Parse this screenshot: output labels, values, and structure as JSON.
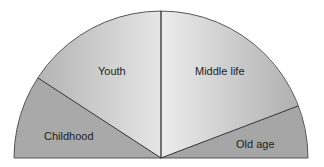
{
  "diagram": {
    "type": "semicircle-segments",
    "segments": [
      {
        "id": "childhood",
        "label": "Childhood",
        "color": "#a8a8a8"
      },
      {
        "id": "youth",
        "label": "Youth",
        "color": "#c4c4c4"
      },
      {
        "id": "middle-life",
        "label": "Middle life",
        "color": "#c8c8c8"
      },
      {
        "id": "old-age",
        "label": "Old age",
        "color": "#a9a9a9"
      }
    ]
  }
}
